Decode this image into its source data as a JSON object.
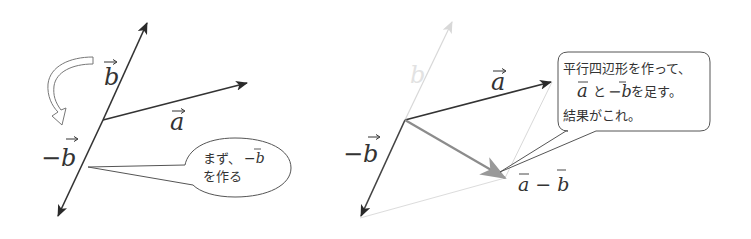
{
  "left_panel": {
    "labels": {
      "b": "b",
      "a": "a",
      "neg_b": "−b",
      "minus": "−"
    },
    "callout": {
      "line1": "まず、",
      "line1_math": "−b",
      "line2": "を作る"
    }
  },
  "right_panel": {
    "labels": {
      "b_faded": "b",
      "a": "a",
      "neg_b": "−b",
      "a_minus_b": "a − b"
    },
    "callout": {
      "line1": "平行四辺形を作って、",
      "line2_a": "a",
      "line2_mid": "と",
      "line2_negb": "−b",
      "line2_end": "を足す。",
      "line3": "結果がこれ。"
    }
  },
  "colors": {
    "vector_dark": "#333333",
    "vector_result": "#8c8c8c",
    "faded": "#d6d6d6",
    "outline": "#555555"
  }
}
